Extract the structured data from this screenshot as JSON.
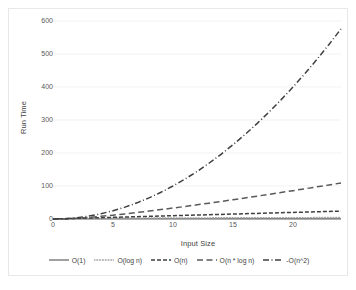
{
  "chart_data": {
    "type": "line",
    "title": "",
    "xlabel": "Input Size",
    "ylabel": "Run Time",
    "xlim": [
      0,
      24
    ],
    "ylim": [
      0,
      600
    ],
    "xticks": [
      0,
      5,
      10,
      15,
      20
    ],
    "yticks": [
      0,
      100,
      200,
      300,
      400,
      500,
      600
    ],
    "grid": "horizontal",
    "legend_position": "bottom",
    "x": [
      0,
      1,
      2,
      3,
      4,
      5,
      6,
      7,
      8,
      9,
      10,
      11,
      12,
      13,
      14,
      15,
      16,
      17,
      18,
      19,
      20,
      21,
      22,
      23,
      24
    ],
    "series": [
      {
        "name": "O(1)",
        "style": "solid",
        "color": "#808080",
        "values": [
          1,
          1,
          1,
          1,
          1,
          1,
          1,
          1,
          1,
          1,
          1,
          1,
          1,
          1,
          1,
          1,
          1,
          1,
          1,
          1,
          1,
          1,
          1,
          1,
          1
        ]
      },
      {
        "name": "O(log n)",
        "style": "dotted",
        "color": "#a6a6a6",
        "values": [
          0,
          0,
          1,
          1.6,
          2,
          2.3,
          2.6,
          2.8,
          3,
          3.2,
          3.3,
          3.5,
          3.6,
          3.7,
          3.8,
          3.9,
          4,
          4.1,
          4.2,
          4.2,
          4.3,
          4.4,
          4.5,
          4.5,
          4.6
        ]
      },
      {
        "name": "O(n)",
        "style": "dashed",
        "color": "#3f3f3f",
        "values": [
          0,
          1,
          2,
          3,
          4,
          5,
          6,
          7,
          8,
          9,
          10,
          11,
          12,
          13,
          14,
          15,
          16,
          17,
          18,
          19,
          20,
          21,
          22,
          23,
          24
        ]
      },
      {
        "name": "O(n * log n)",
        "style": "long-dash",
        "color": "#595959",
        "values": [
          0,
          0,
          2,
          4.8,
          8,
          11.6,
          15.5,
          19.7,
          24,
          28.5,
          33.2,
          38,
          42.9,
          48,
          53.1,
          58.4,
          63.7,
          69.2,
          74.7,
          80.2,
          85.9,
          91.6,
          97.4,
          103.2,
          109.1
        ]
      },
      {
        "name": "-O(n^2)",
        "style": "dash-dot",
        "color": "#404040",
        "values": [
          0,
          1,
          4,
          9,
          16,
          25,
          36,
          49,
          64,
          81,
          100,
          121,
          144,
          169,
          196,
          225,
          256,
          289,
          324,
          361,
          400,
          441,
          484,
          529,
          576
        ]
      }
    ]
  },
  "axes": {
    "ylabel": "Run Time",
    "xlabel": "Input Size",
    "yticks": [
      "600",
      "500",
      "400",
      "300",
      "200",
      "100",
      "0"
    ],
    "xticks": [
      "0",
      "5",
      "10",
      "15",
      "20"
    ]
  },
  "legend": {
    "items": [
      {
        "label": "O(1)"
      },
      {
        "label": "O(log n)"
      },
      {
        "label": "O(n)"
      },
      {
        "label": "O(n * log n)"
      },
      {
        "label": "-O(n^2)"
      }
    ]
  }
}
